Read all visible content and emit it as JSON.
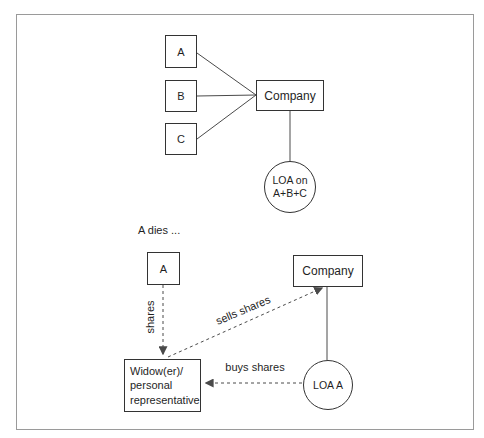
{
  "colors": {
    "line_color": "#4a4a4a",
    "box_border": "#333333",
    "text_color": "#1f1f1f",
    "frame_border": "#9a9a9a"
  },
  "top_diagram": {
    "shareholder_a": "A",
    "shareholder_b": "B",
    "shareholder_c": "C",
    "company": "Company",
    "loa_circle_line1": "LOA on",
    "loa_circle_line2": "A+B+C"
  },
  "bottom_diagram": {
    "caption": "A dies ...",
    "shareholder_a": "A",
    "company": "Company",
    "widow_box": {
      "lines": [
        "Widow(er)/",
        "personal",
        "representative"
      ]
    },
    "loa_circle": "LOA A",
    "labels": {
      "shares": "shares",
      "sells_shares": "sells shares",
      "buys_shares": "buys shares"
    }
  }
}
